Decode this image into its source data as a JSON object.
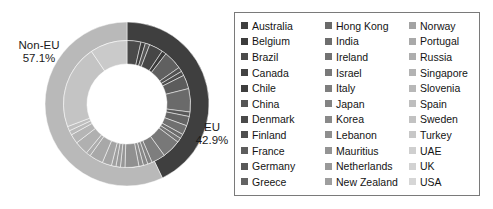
{
  "chart_data": {
    "type": "pie",
    "title": "",
    "subtitle": "",
    "xlabel": "",
    "ylabel": "",
    "legend_position": "right",
    "grid": false,
    "rings": [
      {
        "name": "outer",
        "description": "EU vs Non-EU split",
        "categories": [
          "EU",
          "Non-EU"
        ],
        "values": [
          42.9,
          57.1
        ],
        "labels": [
          "EU 42.9%",
          "Non-EU 42.9%"
        ],
        "colors": [
          "#3f3f3f",
          "#b9b9b9"
        ]
      },
      {
        "name": "inner",
        "description": "Individual countries",
        "categories": [
          "Australia",
          "Belgium",
          "Brazil",
          "Canada",
          "Chile",
          "China",
          "Denmark",
          "Finland",
          "France",
          "Germany",
          "Greece",
          "Hong Kong",
          "India",
          "Ireland",
          "Israel",
          "Italy",
          "Japan",
          "Korea",
          "Lebanon",
          "Mauritius",
          "Netherlands",
          "New Zealand",
          "Norway",
          "Portugal",
          "Russia",
          "Singapore",
          "Slovenia",
          "Spain",
          "Sweden",
          "Turkey",
          "UAE",
          "UK",
          "USA"
        ],
        "values": [
          3.4,
          1.1,
          1.1,
          3.4,
          1.1,
          4.6,
          1.1,
          1.1,
          3.4,
          5.7,
          1.1,
          2.3,
          2.3,
          1.1,
          1.1,
          4.6,
          3.4,
          1.1,
          1.1,
          1.1,
          3.4,
          1.1,
          1.1,
          1.1,
          2.3,
          3.4,
          1.1,
          3.4,
          2.3,
          1.1,
          1.1,
          20.5,
          9.1
        ],
        "colors": [
          "#4a4a4a",
          "#3d3d3d",
          "#565656",
          "#464646",
          "#3a3a3a",
          "#606060",
          "#525252",
          "#4e4e4e",
          "#5c5c5c",
          "#6a6a6a",
          "#585858",
          "#646464",
          "#707070",
          "#6c6c6c",
          "#747474",
          "#787878",
          "#7e7e7e",
          "#828282",
          "#888888",
          "#8c8c8c",
          "#909090",
          "#969696",
          "#9a9a9a",
          "#9e9e9e",
          "#a4a4a4",
          "#a8a8a8",
          "#acacac",
          "#b0b0b0",
          "#b5b5b5",
          "#bababa",
          "#bfbfbf",
          "#c4c4c4",
          "#cacaca"
        ]
      }
    ]
  },
  "labels": {
    "non_eu": {
      "name": "Non-EU",
      "percent": "57.1%"
    },
    "eu": {
      "name": "EU",
      "percent": "42.9%"
    }
  },
  "legend": {
    "columns": 3,
    "rows": 11,
    "items": [
      {
        "label": "Australia",
        "color": "#3f3f3f"
      },
      {
        "label": "Belgium",
        "color": "#3c3c3c"
      },
      {
        "label": "Brazil",
        "color": "#4b4b4b"
      },
      {
        "label": "Canada",
        "color": "#434343"
      },
      {
        "label": "Chile",
        "color": "#3e3e3e"
      },
      {
        "label": "China",
        "color": "#555555"
      },
      {
        "label": "Denmark",
        "color": "#4a4a4a"
      },
      {
        "label": "Finland",
        "color": "#4e4e4e"
      },
      {
        "label": "France",
        "color": "#5d5d5d"
      },
      {
        "label": "Germany",
        "color": "#585858"
      },
      {
        "label": "Greece",
        "color": "#636363"
      },
      {
        "label": "Hong Kong",
        "color": "#6a6a6a"
      },
      {
        "label": "India",
        "color": "#6e6e6e"
      },
      {
        "label": "Ireland",
        "color": "#727272"
      },
      {
        "label": "Israel",
        "color": "#797979"
      },
      {
        "label": "Italy",
        "color": "#7e7e7e"
      },
      {
        "label": "Japan",
        "color": "#838383"
      },
      {
        "label": "Korea",
        "color": "#898989"
      },
      {
        "label": "Lebanon",
        "color": "#8e8e8e"
      },
      {
        "label": "Mauritius",
        "color": "#949494"
      },
      {
        "label": "Netherlands",
        "color": "#999999"
      },
      {
        "label": "New Zealand",
        "color": "#9e9e9e"
      },
      {
        "label": "Norway",
        "color": "#a3a3a3"
      },
      {
        "label": "Portugal",
        "color": "#a9a9a9"
      },
      {
        "label": "Russia",
        "color": "#aeaeae"
      },
      {
        "label": "Singapore",
        "color": "#b3b3b3"
      },
      {
        "label": "Slovenia",
        "color": "#b8b8b8"
      },
      {
        "label": "Spain",
        "color": "#bebebe"
      },
      {
        "label": "Sweden",
        "color": "#c2c2c2"
      },
      {
        "label": "Turkey",
        "color": "#c7c7c7"
      },
      {
        "label": "UAE",
        "color": "#cfcfcf"
      },
      {
        "label": "UK",
        "color": "#d2d2d2"
      },
      {
        "label": "USA",
        "color": "#d6d6d6"
      }
    ]
  }
}
